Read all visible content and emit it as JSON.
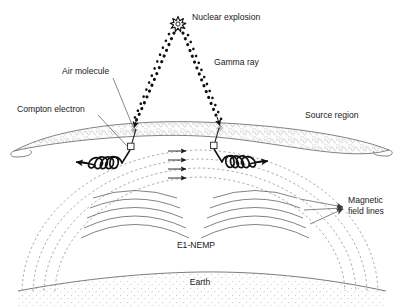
{
  "figure": {
    "background_color": "#ffffff",
    "width": 403,
    "height": 307
  },
  "labels": {
    "nuclear_explosion": "Nuclear explosion",
    "gamma_ray": "Gamma ray",
    "air_molecule": "Air molecule",
    "compton_electron": "Compton electron",
    "source_region": "Source region",
    "magnetic_field_lines_1": "Magnetic",
    "magnetic_field_lines_2": "field lines",
    "e1_nemp": "E1-NEMP",
    "earth": "Earth"
  },
  "colors": {
    "line_dark": "#2b2b2b",
    "line_mid": "#6d6d6d",
    "dashed_field": "#9a9a9a",
    "wave_arc": "#5a5a5a",
    "source_region_fill": "#fdfdfd",
    "source_region_hatch": "#cfcfcf",
    "earth_stipple": "#c8c8c8",
    "text": "#1a1a1a"
  },
  "elements": {
    "burst_center": [
      178,
      24
    ],
    "gamma_left_end": [
      134,
      128
    ],
    "gamma_right_end": [
      220,
      126
    ],
    "compton_marker_left": [
      131,
      147
    ],
    "compton_marker_right": [
      213,
      146
    ],
    "field_arrow_count": 4,
    "dashed_arc_count": 4,
    "wave_arc_groups": 2,
    "wave_arcs_per_group": 5
  }
}
